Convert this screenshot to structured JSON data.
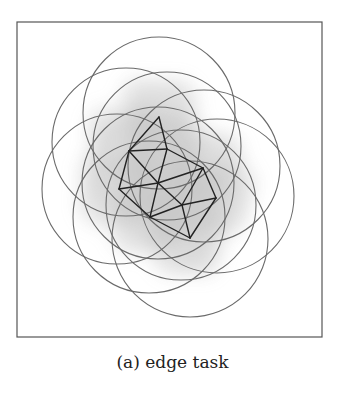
{
  "caption": "(a) edge task",
  "frame": {
    "x": 17,
    "y": 22,
    "width": 305,
    "height": 315,
    "stroke": "#555555"
  },
  "colors": {
    "circle_stroke": "#6a6a6a",
    "edge_stroke": "#222222",
    "cloud_fill": "#9a9a9a"
  },
  "nodes": [
    {
      "id": "top",
      "x": 159,
      "y": 117
    },
    {
      "id": "upper-left",
      "x": 129,
      "y": 151
    },
    {
      "id": "upper-mid",
      "x": 167,
      "y": 149
    },
    {
      "id": "left",
      "x": 119,
      "y": 189
    },
    {
      "id": "center",
      "x": 158,
      "y": 183
    },
    {
      "id": "right-upper",
      "x": 203,
      "y": 168
    },
    {
      "id": "right",
      "x": 216,
      "y": 198
    },
    {
      "id": "mid-lower",
      "x": 182,
      "y": 205
    },
    {
      "id": "lower-left",
      "x": 150,
      "y": 217
    },
    {
      "id": "bottom",
      "x": 190,
      "y": 238
    }
  ],
  "edges": [
    [
      "top",
      "upper-left"
    ],
    [
      "top",
      "upper-mid"
    ],
    [
      "upper-left",
      "upper-mid"
    ],
    [
      "upper-left",
      "left"
    ],
    [
      "upper-left",
      "center"
    ],
    [
      "upper-mid",
      "center"
    ],
    [
      "upper-mid",
      "right-upper"
    ],
    [
      "left",
      "center"
    ],
    [
      "center",
      "right-upper"
    ],
    [
      "center",
      "mid-lower"
    ],
    [
      "center",
      "lower-left"
    ],
    [
      "right-upper",
      "right"
    ],
    [
      "right-upper",
      "mid-lower"
    ],
    [
      "lower-left",
      "mid-lower"
    ],
    [
      "mid-lower",
      "right"
    ],
    [
      "left",
      "lower-left"
    ],
    [
      "lower-left",
      "bottom"
    ],
    [
      "mid-lower",
      "bottom"
    ],
    [
      "right",
      "bottom"
    ]
  ],
  "circles": [
    {
      "cx": 159,
      "cy": 113,
      "r": 76
    },
    {
      "cx": 126,
      "cy": 142,
      "r": 74
    },
    {
      "cx": 167,
      "cy": 146,
      "r": 74
    },
    {
      "cx": 117,
      "cy": 189,
      "r": 75
    },
    {
      "cx": 158,
      "cy": 183,
      "r": 76
    },
    {
      "cx": 204,
      "cy": 166,
      "r": 76
    },
    {
      "cx": 217,
      "cy": 196,
      "r": 77
    },
    {
      "cx": 181,
      "cy": 205,
      "r": 75
    },
    {
      "cx": 149,
      "cy": 217,
      "r": 76
    },
    {
      "cx": 190,
      "cy": 239,
      "r": 78
    }
  ]
}
